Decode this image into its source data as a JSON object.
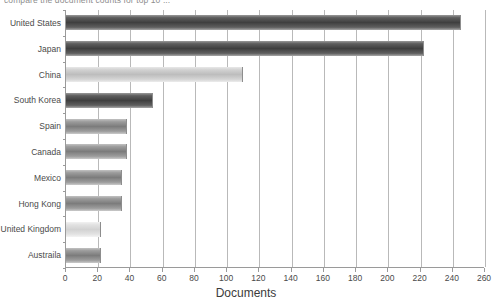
{
  "caption": "compare the document counts for top 10 ...",
  "chart_data": {
    "type": "bar",
    "orientation": "horizontal",
    "title": "",
    "xlabel": "Documents",
    "ylabel": "",
    "xlim": [
      0,
      260
    ],
    "xticks": [
      0,
      20,
      40,
      60,
      80,
      100,
      120,
      140,
      160,
      180,
      200,
      220,
      240,
      260
    ],
    "grid": true,
    "legend": false,
    "categories": [
      "United States",
      "Japan",
      "China",
      "South Korea",
      "Spain",
      "Canada",
      "Mexico",
      "Hong Kong",
      "United Kingdom",
      "Austraila"
    ],
    "values": [
      245,
      222,
      110,
      54,
      38,
      38,
      35,
      35,
      22,
      22
    ],
    "bar_tones": [
      "dark",
      "dark",
      "light",
      "dark",
      "mid",
      "mid",
      "mid",
      "mid",
      "pale",
      "mid"
    ]
  },
  "colors": {
    "axis": "#9a9a9a",
    "gridline": "#b9b9b9",
    "text": "#3b3b3b",
    "bar_dark": "#3f3f3f",
    "bar_mid": "#7c7c7c",
    "bar_light": "#bdbdbd",
    "bar_pale": "#d2d2d2"
  }
}
